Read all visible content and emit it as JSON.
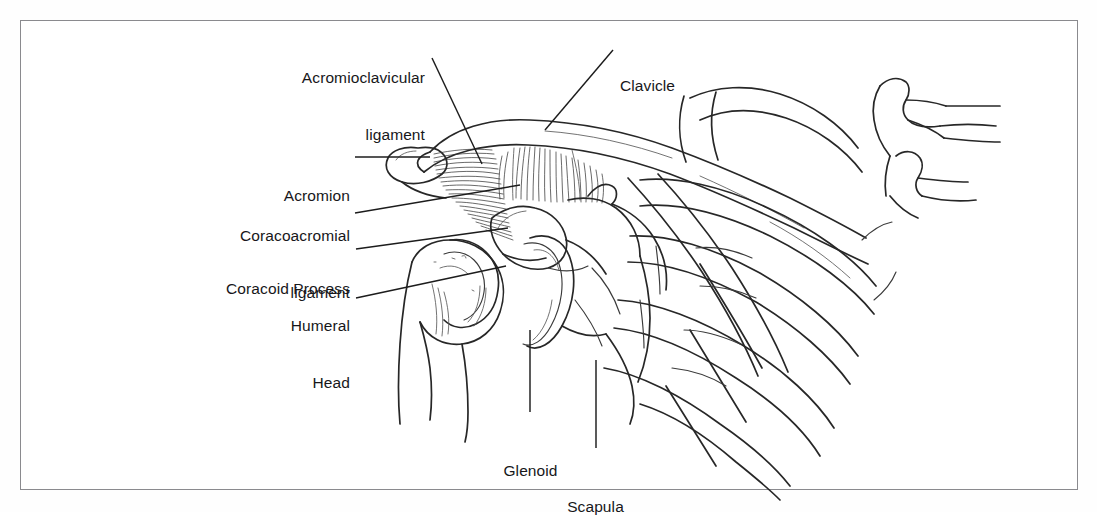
{
  "figure": {
    "background_color": "#ffffff",
    "line_color": "#272727",
    "frame_color": "#8a8a8e",
    "text_color": "#17171a"
  },
  "labels": [
    {
      "id": "acromioclavicular-ligament",
      "line1": "Acromioclavicular",
      "line2": "ligament",
      "align": "right",
      "x": 255,
      "y": 30,
      "width": 170
    },
    {
      "id": "clavicle",
      "line1": "Clavicle",
      "line2": "",
      "align": "left",
      "x": 620,
      "y": 38,
      "width": 120
    },
    {
      "id": "acromion",
      "line1": "Acromion",
      "line2": "",
      "align": "right",
      "x": 195,
      "y": 148,
      "width": 155
    },
    {
      "id": "coracoacromial-ligament",
      "line1": "Coracoacromial",
      "line2": "ligament",
      "align": "right",
      "x": 190,
      "y": 188,
      "width": 160
    },
    {
      "id": "coracoid-process",
      "line1": "Coracoid Process",
      "line2": "",
      "align": "right",
      "x": 182,
      "y": 241,
      "width": 168
    },
    {
      "id": "humeral-head",
      "line1": "Humeral",
      "line2": "Head",
      "align": "right",
      "x": 215,
      "y": 278,
      "width": 135
    },
    {
      "id": "glenoid",
      "line1": "Glenoid",
      "line2": "",
      "align": "center",
      "x": 488,
      "y": 423,
      "width": 85
    },
    {
      "id": "scapula",
      "line1": "Scapula",
      "line2": "",
      "align": "center",
      "x": 553,
      "y": 459,
      "width": 85
    }
  ],
  "structures": [
    {
      "id": "clavicle",
      "name": "Clavicle"
    },
    {
      "id": "acromion",
      "name": "Acromion"
    },
    {
      "id": "acromioclavicular-ligament",
      "name": "Acromioclavicular ligament"
    },
    {
      "id": "coracoacromial-ligament",
      "name": "Coracoacromial ligament"
    },
    {
      "id": "coracoid-process",
      "name": "Coracoid Process"
    },
    {
      "id": "humeral-head",
      "name": "Humeral Head"
    },
    {
      "id": "glenoid",
      "name": "Glenoid"
    },
    {
      "id": "scapula",
      "name": "Scapula"
    },
    {
      "id": "ribs",
      "name": "Ribs"
    },
    {
      "id": "vertebrae",
      "name": "Vertebral bodies"
    }
  ]
}
